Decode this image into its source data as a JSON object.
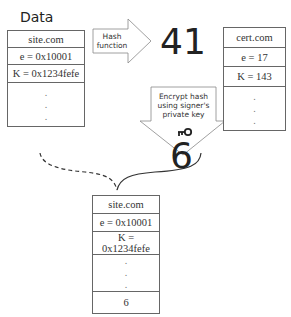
{
  "data_label": "Data",
  "source_record": {
    "rows": [
      "site.com",
      "e = 0x10001",
      "K = 0x1234fefe"
    ],
    "dots": [
      ".",
      ".",
      "."
    ]
  },
  "hash_arrow": {
    "line1": "Hash",
    "line2": "function"
  },
  "hash_value": "41",
  "cert_record": {
    "rows": [
      "cert.com",
      "e = 17",
      "K = 143"
    ],
    "dots": [
      ".",
      ".",
      "."
    ]
  },
  "encrypt_arrow": {
    "line1": "Encrypt hash",
    "line2": "using signer's",
    "line3": "private key",
    "icon": "key-icon"
  },
  "signature_value": "6",
  "signed_record": {
    "rows": [
      "site.com",
      "e = 0x10001",
      "K = 0x1234fefe"
    ],
    "dots": [
      ".",
      ".",
      "."
    ],
    "signature": "6"
  }
}
